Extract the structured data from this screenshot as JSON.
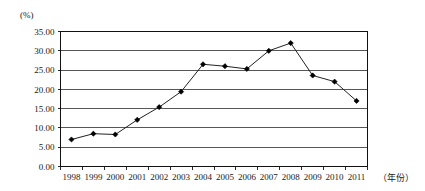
{
  "chart_data": {
    "type": "line",
    "title": "",
    "subtitle": "",
    "xlabel": "（年份）",
    "ylabel": "(%)",
    "categories": [
      "1998",
      "1999",
      "2000",
      "2001",
      "2002",
      "2003",
      "2004",
      "2005",
      "2006",
      "2007",
      "2008",
      "2009",
      "2010",
      "2011"
    ],
    "x": [
      1998,
      1999,
      2000,
      2001,
      2002,
      2003,
      2004,
      2005,
      2006,
      2007,
      2008,
      2009,
      2010,
      2011
    ],
    "values": [
      7.0,
      8.5,
      8.3,
      12.1,
      15.4,
      19.4,
      26.5,
      26.0,
      25.3,
      30.0,
      32.0,
      23.6,
      22.0,
      17.0
    ],
    "series": [
      {
        "name": "",
        "values": [
          7.0,
          8.5,
          8.3,
          12.1,
          15.4,
          19.4,
          26.5,
          26.0,
          25.3,
          30.0,
          32.0,
          23.6,
          22.0,
          17.0
        ]
      }
    ],
    "ylim": [
      0,
      35
    ],
    "ytick_values": [
      0,
      5,
      10,
      15,
      20,
      25,
      30,
      35
    ],
    "ytick_labels": [
      "0.00",
      "5.00",
      "10.00",
      "15.00",
      "20.00",
      "25.00",
      "30.00",
      "35.00"
    ],
    "grid": "horizontal",
    "legend": "none",
    "marker": "diamond",
    "line_color": "#222222",
    "marker_color": "#000000",
    "grid_color": "#444444"
  }
}
